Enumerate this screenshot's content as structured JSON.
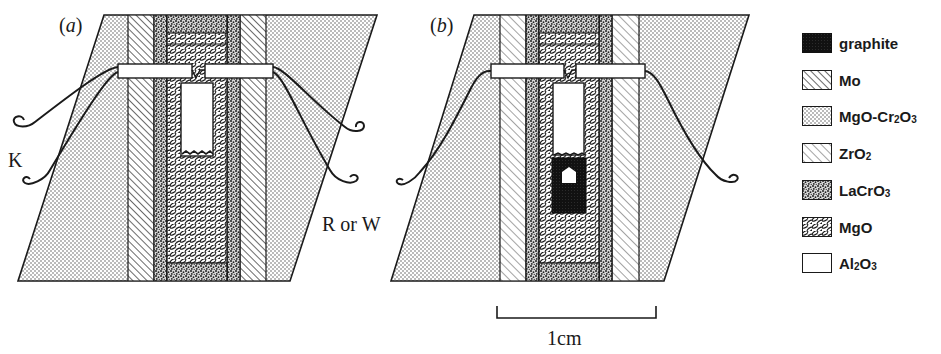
{
  "panels": [
    {
      "id": "a",
      "label_open": "(",
      "label_letter": "a",
      "label_close": ")",
      "heater": "Mo",
      "sample_container": "Al2O3"
    },
    {
      "id": "b",
      "label_open": "(",
      "label_letter": "b",
      "label_close": ")",
      "heater": "Mo",
      "sample_container": "graphite"
    }
  ],
  "thermocouple_labels": {
    "left": "K",
    "right": "R or W"
  },
  "scale_bar": {
    "label": "1cm"
  },
  "legend": {
    "items": [
      {
        "name": "graphite",
        "label": "graphite",
        "pattern": "graphite-solid"
      },
      {
        "name": "mo",
        "label_main": "Mo",
        "label_sub": "",
        "label_tail": "",
        "pattern": "dense-diagonal-hatch"
      },
      {
        "name": "mgo-cr2o3",
        "label_main": "MgO-Cr",
        "label_sub": "2",
        "label_tail": "O",
        "label_sub2": "3",
        "pattern": "fine-dots"
      },
      {
        "name": "zro2",
        "label_main": "ZrO",
        "label_sub": "2",
        "pattern": "light-diagonal-hatch"
      },
      {
        "name": "lacro3",
        "label_main": "LaCrO",
        "label_sub": "3",
        "pattern": "coarse-stipple"
      },
      {
        "name": "mgo",
        "label_main": "MgO",
        "label_sub": "",
        "pattern": "brick-scales"
      },
      {
        "name": "al2o3",
        "label_main": "Al",
        "label_sub": "2",
        "label_tail": "O",
        "label_sub2": "3",
        "pattern": "blank"
      }
    ]
  },
  "colors": {
    "ink": "#1a1a1a",
    "paper": "#ffffff",
    "graphite": "#111111"
  }
}
